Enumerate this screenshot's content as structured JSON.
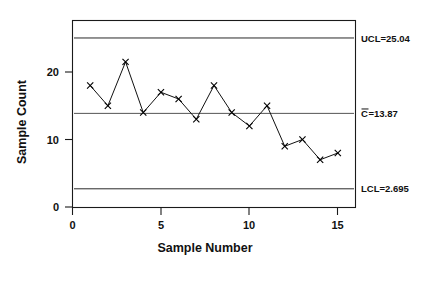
{
  "chart_data": {
    "type": "line",
    "title": "",
    "subtitle": "",
    "xlabel": "Sample Number",
    "ylabel": "Sample Count",
    "x": [
      1,
      2,
      3,
      4,
      5,
      6,
      7,
      8,
      9,
      10,
      11,
      12,
      13,
      14,
      15
    ],
    "values": [
      18,
      15,
      21.5,
      14,
      17,
      16,
      13,
      18,
      14,
      12,
      15,
      9,
      10,
      7,
      8
    ],
    "series": [
      {
        "name": "Sample Count",
        "values": [
          18,
          15,
          21.5,
          14,
          17,
          16,
          13,
          18,
          14,
          12,
          15,
          9,
          10,
          7,
          8
        ]
      }
    ],
    "marker": "x",
    "xlim": [
      0,
      16
    ],
    "ylim": [
      0,
      26.5
    ],
    "xticks": [
      0,
      5,
      10,
      15
    ],
    "xtick_labels": [
      "0",
      "5",
      "10",
      "15"
    ],
    "yticks": [
      0,
      10,
      20
    ],
    "ytick_labels": [
      "0",
      "10",
      "20"
    ],
    "grid": false,
    "legend": false,
    "legend_position": "none",
    "control_lines": [
      {
        "id": "ucl",
        "value": 25.04,
        "label": "UCL=25.04",
        "label_prefix": "UCL=",
        "label_value": "25.04",
        "overbar": false
      },
      {
        "id": "center",
        "value": 13.87,
        "label": "C=13.87",
        "label_prefix": "C",
        "label_value": "=13.87",
        "overbar": true
      },
      {
        "id": "lcl",
        "value": 2.695,
        "label": "LCL=2.695",
        "label_prefix": "LCL=",
        "label_value": "2.695",
        "overbar": false
      }
    ]
  },
  "axes": {
    "x_title": "Sample Number",
    "y_title": "Sample Count",
    "x_tick_labels": [
      "0",
      "5",
      "10",
      "15"
    ],
    "y_tick_labels": [
      "0",
      "10",
      "20"
    ]
  },
  "annotations": {
    "ucl_label": "UCL=25.04",
    "center_label_symbol": "C",
    "center_label_value": "=13.87",
    "lcl_label": "LCL=2.695"
  },
  "colors": {
    "line": "#111111",
    "marker": "#000000",
    "limit": "#2a2a2a",
    "center": "#555555",
    "frame": "#1a1a1a",
    "background": "#ffffff"
  }
}
